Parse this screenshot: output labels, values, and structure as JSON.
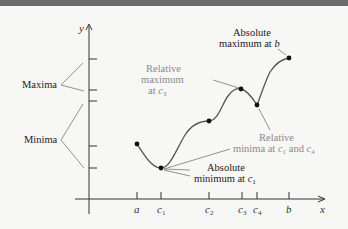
{
  "diagram": {
    "axes": {
      "x_label": "x",
      "y_label": "y"
    },
    "x_ticks": [
      {
        "id": "a",
        "label": "a",
        "sub": ""
      },
      {
        "id": "c1",
        "label": "c",
        "sub": "1"
      },
      {
        "id": "c2",
        "label": "c",
        "sub": "2"
      },
      {
        "id": "c3",
        "label": "c",
        "sub": "3"
      },
      {
        "id": "c4",
        "label": "c",
        "sub": "4"
      },
      {
        "id": "b",
        "label": "b",
        "sub": ""
      }
    ],
    "left_labels": {
      "maxima": "Maxima",
      "minima": "Minima"
    },
    "annotations": {
      "absolute_max_line1": "Absolute",
      "absolute_max_line2": "maximum at ",
      "absolute_max_var": "b",
      "relative_max_line1": "Relative",
      "relative_max_line2": "maximum",
      "relative_max_line3": "at ",
      "relative_max_var": "c",
      "relative_max_sub": "3",
      "relative_min_line1": "Relative",
      "relative_min_line2": "minima at ",
      "relative_min_var1": "c",
      "relative_min_sub1": "1",
      "relative_min_and": " and ",
      "relative_min_var2": "c",
      "relative_min_sub2": "4",
      "absolute_min_line1": "Absolute",
      "absolute_min_line2": "minimum at ",
      "absolute_min_var": "c",
      "absolute_min_sub": "1"
    },
    "points": [
      {
        "id": "a",
        "x": 137,
        "y": 144
      },
      {
        "id": "c1",
        "x": 161,
        "y": 168
      },
      {
        "id": "c2",
        "x": 209,
        "y": 121
      },
      {
        "id": "c3",
        "x": 241,
        "y": 89
      },
      {
        "id": "c4",
        "x": 257,
        "y": 105
      },
      {
        "id": "b",
        "x": 289,
        "y": 58
      }
    ],
    "colors": {
      "curve": "#555555",
      "point": "#111111",
      "axis": "#333333",
      "gray_text": "#8a8a8a"
    }
  }
}
